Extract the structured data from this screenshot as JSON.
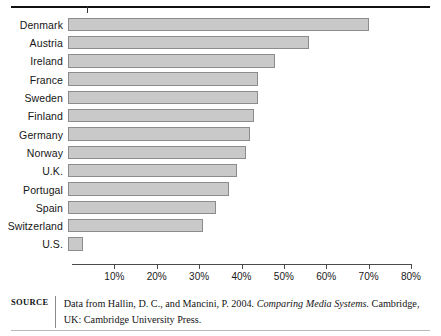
{
  "chart_data": {
    "type": "bar",
    "orientation": "horizontal",
    "title": "",
    "subtitle": "",
    "xlabel": "",
    "ylabel": "",
    "categories": [
      "Denmark",
      "Austria",
      "Ireland",
      "France",
      "Sweden",
      "Finland",
      "Germany",
      "Norway",
      "U.K.",
      "Portugal",
      "Spain",
      "Switzerland",
      "U.S."
    ],
    "values": [
      70,
      56,
      48,
      44,
      44,
      43,
      42,
      41,
      39,
      37,
      34,
      31,
      2.5
    ],
    "value_unit": "%",
    "xlim": [
      0,
      80
    ],
    "tick_labels": [
      "10%",
      "20%",
      "30%",
      "40%",
      "50%",
      "60%",
      "70%",
      "80%"
    ],
    "tick_values": [
      10,
      20,
      30,
      40,
      50,
      60,
      70,
      80
    ],
    "grid": false,
    "legend": null,
    "bar_fill_color": "#c9c9c9",
    "bar_border_color": "#8c8c8c"
  },
  "source": {
    "label": "SOURCE",
    "text_before_italic": "Data from Hallin, D. C., and Mancini, P. 2004. ",
    "italic_title": "Comparing Media Systems.",
    "text_after_italic": " Cambridge, UK: Cambridge University Press."
  }
}
